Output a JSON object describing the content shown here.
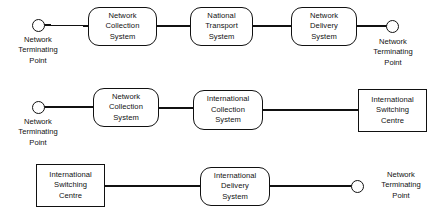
{
  "diagram": {
    "type": "block-flow-diagram",
    "stroke_color": "#111111",
    "background_color": "#ffffff",
    "rows": [
      {
        "id": "row-national-call",
        "nodes": [
          {
            "id": "r1-ntp-left",
            "kind": "circle",
            "label_lines": [
              "Network",
              "Terminating",
              "Point"
            ],
            "label_position": "below"
          },
          {
            "id": "r1-network-collection-system",
            "kind": "rounded-box",
            "label_lines": [
              "Network",
              "Collection",
              "System"
            ]
          },
          {
            "id": "r1-national-transport-system",
            "kind": "rounded-box",
            "label_lines": [
              "National",
              "Transport",
              "System"
            ]
          },
          {
            "id": "r1-network-delivery-system",
            "kind": "rounded-box",
            "label_lines": [
              "Network",
              "Delivery",
              "System"
            ]
          },
          {
            "id": "r1-ntp-right",
            "kind": "circle",
            "label_lines": [
              "Network",
              "Terminating",
              "Point"
            ],
            "label_position": "below"
          }
        ]
      },
      {
        "id": "row-outgoing-international",
        "nodes": [
          {
            "id": "r2-ntp-left",
            "kind": "circle",
            "label_lines": [
              "Network",
              "Terminating",
              "Point"
            ],
            "label_position": "below"
          },
          {
            "id": "r2-network-collection-system",
            "kind": "rounded-box",
            "label_lines": [
              "Network",
              "Collection",
              "System"
            ]
          },
          {
            "id": "r2-international-collection-system",
            "kind": "rounded-box",
            "label_lines": [
              "International",
              "Collection",
              "System"
            ]
          },
          {
            "id": "r2-international-switching-centre",
            "kind": "square-box",
            "label_lines": [
              "International",
              "Switching",
              "Centre"
            ]
          }
        ]
      },
      {
        "id": "row-incoming-international",
        "nodes": [
          {
            "id": "r3-international-switching-centre",
            "kind": "square-box",
            "label_lines": [
              "International",
              "Switching",
              "Centre"
            ]
          },
          {
            "id": "r3-international-delivery-system",
            "kind": "rounded-box",
            "label_lines": [
              "International",
              "Delivery",
              "System"
            ]
          },
          {
            "id": "r3-ntp-right",
            "kind": "circle",
            "label_lines": [
              "Network",
              "Terminating",
              "Point"
            ],
            "label_position": "right"
          }
        ]
      }
    ]
  }
}
